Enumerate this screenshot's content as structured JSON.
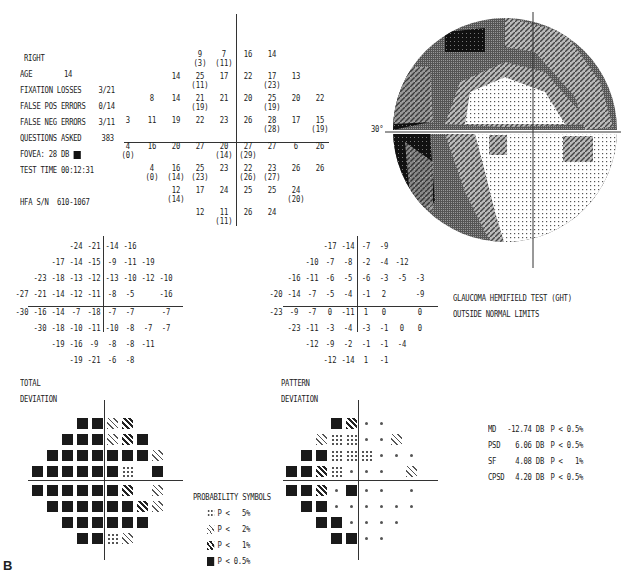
{
  "header": {
    "eye": "RIGHT",
    "age_label": "AGE",
    "age": "14",
    "fixation_losses_label": "FIXATION LOSSES",
    "fixation_losses": "3/21",
    "false_pos_label": "FALSE POS ERRORS",
    "false_pos": "0/14",
    "false_neg_label": "FALSE NEG ERRORS",
    "false_neg": "3/11",
    "questions_label": "QUESTIONS ASKED",
    "questions": "383",
    "fovea_label": "FOVEA:",
    "fovea": "28 DB",
    "test_time_label": "TEST TIME",
    "test_time": "00:12:31",
    "hfa_label": "HFA S/N",
    "hfa_sn": "610-1067"
  },
  "threshold_plot": {
    "rows": [
      [
        [
          "9",
          "(3)"
        ],
        [
          "7",
          "(11)"
        ],
        [
          "16",
          ""
        ],
        [
          "14",
          ""
        ]
      ],
      [
        [
          "14",
          ""
        ],
        [
          "25",
          "(11)"
        ],
        [
          "17",
          ""
        ],
        [
          "22",
          ""
        ],
        [
          "17",
          "(23)"
        ],
        [
          "13",
          ""
        ]
      ],
      [
        [
          "8",
          ""
        ],
        [
          "14",
          ""
        ],
        [
          "21",
          "(19)"
        ],
        [
          "21",
          ""
        ],
        [
          "20",
          ""
        ],
        [
          "25",
          "(19)"
        ],
        [
          "20",
          ""
        ],
        [
          "22",
          ""
        ]
      ],
      [
        [
          "3",
          ""
        ],
        [
          "11",
          ""
        ],
        [
          "19",
          ""
        ],
        [
          "22",
          ""
        ],
        [
          "23",
          ""
        ],
        [
          "26",
          ""
        ],
        [
          "28",
          "(28)"
        ],
        [
          "17",
          ""
        ],
        [
          "15",
          "(19)"
        ]
      ],
      [
        [
          "4",
          "(0)"
        ],
        [
          "16",
          ""
        ],
        [
          "20",
          ""
        ],
        [
          "27",
          ""
        ],
        [
          "20",
          "(14)"
        ],
        [
          "27",
          "(29)"
        ],
        [
          "27",
          ""
        ],
        [
          "6",
          ""
        ],
        [
          "26",
          ""
        ]
      ],
      [
        [
          "4",
          "(0)"
        ],
        [
          "16",
          "(14)"
        ],
        [
          "25",
          "(23)"
        ],
        [
          "23",
          ""
        ],
        [
          "22",
          "(26)"
        ],
        [
          "23",
          "(27)"
        ],
        [
          "26",
          ""
        ],
        [
          "26",
          ""
        ]
      ],
      [
        [
          "12",
          "(14)"
        ],
        [
          "17",
          ""
        ],
        [
          "24",
          ""
        ],
        [
          "25",
          ""
        ],
        [
          "25",
          ""
        ],
        [
          "24",
          "(20)"
        ]
      ],
      [
        [
          "12",
          ""
        ],
        [
          "11",
          "(11)"
        ],
        [
          "26",
          ""
        ],
        [
          "24",
          ""
        ]
      ]
    ]
  },
  "grayscale": {
    "label_30": "30°"
  },
  "total_deviation": {
    "title_line1": "TOTAL",
    "title_line2": "DEVIATION",
    "rows": [
      [
        "-24",
        "-21",
        "-14",
        "-16"
      ],
      [
        "-17",
        "-14",
        "-15",
        "-9",
        "-11",
        "-19"
      ],
      [
        "-23",
        "-18",
        "-13",
        "-12",
        "-13",
        "-10",
        "-12",
        "-10"
      ],
      [
        "-27",
        "-21",
        "-14",
        "-12",
        "-11",
        "-8",
        "-5",
        "",
        "-16"
      ],
      [
        "-30",
        "-16",
        "-14",
        "-7",
        "-18",
        "-7",
        "-7",
        "",
        "-7"
      ],
      [
        "-30",
        "-18",
        "-10",
        "-11",
        "-10",
        "-8",
        "-7",
        "-7"
      ],
      [
        "-19",
        "-16",
        "-9",
        "-8",
        "-8",
        "-11"
      ],
      [
        "-19",
        "-21",
        "-6",
        "-8"
      ]
    ],
    "prob_rows": [
      [
        "05",
        "05",
        "2",
        "1"
      ],
      [
        "05",
        "05",
        "05",
        "2",
        "1",
        "05"
      ],
      [
        "05",
        "05",
        "05",
        "05",
        "05",
        "05",
        "05",
        "2"
      ],
      [
        "05",
        "05",
        "05",
        "05",
        "05",
        "05",
        "5",
        "",
        "05"
      ],
      [
        "05",
        "05",
        "05",
        "05",
        "05",
        "05",
        "1",
        "",
        "2"
      ],
      [
        "05",
        "05",
        "05",
        "05",
        "05",
        "05",
        "1",
        "2"
      ],
      [
        "05",
        "05",
        "05",
        "05",
        "05",
        "05"
      ],
      [
        "05",
        "05",
        "5",
        "2"
      ]
    ]
  },
  "pattern_deviation": {
    "title_line1": "PATTERN",
    "title_line2": "DEVIATION",
    "rows": [
      [
        "-17",
        "-14",
        "-7",
        "-9"
      ],
      [
        "-10",
        "-7",
        "-8",
        "-2",
        "-4",
        "-12"
      ],
      [
        "-16",
        "-11",
        "-6",
        "-5",
        "-6",
        "-3",
        "-5",
        "-3"
      ],
      [
        "-20",
        "-14",
        "-7",
        "-5",
        "-4",
        "-1",
        "2",
        "",
        "-9"
      ],
      [
        "-23",
        "-9",
        "-7",
        "0",
        "-11",
        "1",
        "0",
        "",
        "0"
      ],
      [
        "-23",
        "-11",
        "-3",
        "-4",
        "-3",
        "-1",
        "0",
        "0"
      ],
      [
        "-12",
        "-9",
        "-2",
        "-1",
        "-1",
        "-4"
      ],
      [
        "-12",
        "-14",
        "1",
        "-1"
      ]
    ],
    "prob_rows": [
      [
        "05",
        "1",
        "n",
        "n"
      ],
      [
        "2",
        "5",
        "5",
        "n",
        "n",
        "2"
      ],
      [
        "05",
        "05",
        "5",
        "5",
        "5",
        "n",
        "n",
        "n"
      ],
      [
        "05",
        "05",
        "1",
        "5",
        "n",
        "n",
        "n",
        "",
        "2"
      ],
      [
        "05",
        "05",
        "1",
        "n",
        "05",
        "n",
        "n",
        "",
        "n"
      ],
      [
        "05",
        "05",
        "n",
        "n",
        "n",
        "n",
        "n",
        "n"
      ],
      [
        "05",
        "05",
        "n",
        "n",
        "n",
        "n"
      ],
      [
        "05",
        "05",
        "n",
        "n"
      ]
    ]
  },
  "ght": {
    "line1": "GLAUCOMA HEMIFIELD TEST (GHT)",
    "line2": "OUTSIDE NORMAL LIMITS"
  },
  "indices": [
    {
      "name": "MD",
      "value": "-12.74 DB",
      "p": "P < 0.5%"
    },
    {
      "name": "PSD",
      "value": "6.06 DB",
      "p": "P < 0.5%"
    },
    {
      "name": "SF",
      "value": "4.08 DB",
      "p": "P <   1%"
    },
    {
      "name": "CPSD",
      "value": "4.20 DB",
      "p": "P < 0.5%"
    }
  ],
  "legend": {
    "title": "PROBABILITY SYMBOLS",
    "items": [
      {
        "sym": "s5",
        "label": "P <   5%"
      },
      {
        "sym": "s2",
        "label": "P <   2%"
      },
      {
        "sym": "s1",
        "label": "P <   1%"
      },
      {
        "sym": "s05",
        "label": "P < 0.5%"
      }
    ]
  },
  "figure_label": "B"
}
